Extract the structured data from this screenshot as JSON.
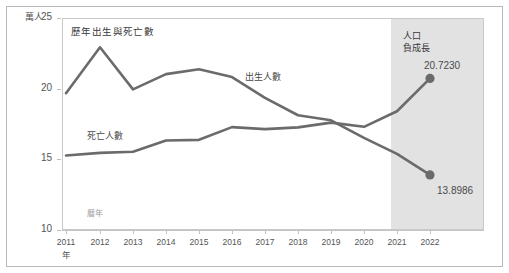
{
  "chart_data": {
    "type": "line",
    "title": "歷年出生與死亡數",
    "xlabel": "年",
    "ylabel": "萬人",
    "x": [
      2011,
      2012,
      2013,
      2014,
      2015,
      2016,
      2017,
      2018,
      2019,
      2020,
      2021,
      2022
    ],
    "categories": [
      "2011",
      "2012",
      "2013",
      "2014",
      "2015",
      "2016",
      "2017",
      "2018",
      "2019",
      "2020",
      "2021",
      "2022"
    ],
    "ylim": [
      10,
      25
    ],
    "yticks": [
      10,
      15,
      20,
      25
    ],
    "ytick_labels": [
      "10",
      "15",
      "20",
      "25"
    ],
    "grid": false,
    "legend_position": "inline-labels",
    "series": [
      {
        "name": "出生人數",
        "color": "#6b6b6b",
        "values": [
          19.68,
          22.93,
          19.95,
          21.03,
          21.37,
          20.82,
          19.35,
          18.12,
          17.76,
          16.52,
          15.39,
          13.8986
        ],
        "end_label": "13.8986"
      },
      {
        "name": "死亡人數",
        "color": "#6b6b6b",
        "values": [
          15.27,
          15.46,
          15.54,
          16.33,
          16.38,
          17.28,
          17.14,
          17.26,
          17.6,
          17.3,
          18.4,
          20.723
        ],
        "end_label": "20.7230"
      }
    ],
    "annotations": [
      {
        "text": "人口\n負成長",
        "line1": "人口",
        "line2": "負成長",
        "from_x": 2020,
        "to_x": 2022,
        "shaded": true
      },
      {
        "text": "曆年",
        "note": "small inner axis note"
      }
    ]
  },
  "labels": {
    "title": "歷年出生與死亡數",
    "y_unit": "萬人",
    "x_unit": "年",
    "band_line1": "人口",
    "band_line2": "負成長",
    "series_births": "出生人數",
    "series_deaths": "死亡人數",
    "inner_note": "曆年",
    "value_top_right": "20.7230",
    "value_bottom_right": "13.8986"
  },
  "yticks": [
    {
      "label": "25",
      "top": 18
    },
    {
      "label": "20",
      "top": 88.7
    },
    {
      "label": "15",
      "top": 159.3
    },
    {
      "label": "10",
      "top": 230
    }
  ],
  "xticks": [
    {
      "label": "2011",
      "x": 66
    },
    {
      "label": "2012",
      "x": 100
    },
    {
      "label": "2013",
      "x": 133
    },
    {
      "label": "2014",
      "x": 166
    },
    {
      "label": "2015",
      "x": 199
    },
    {
      "label": "2016",
      "x": 232
    },
    {
      "label": "2017",
      "x": 265
    },
    {
      "label": "2018",
      "x": 298
    },
    {
      "label": "2019",
      "x": 331
    },
    {
      "label": "2020",
      "x": 364
    },
    {
      "label": "2021",
      "x": 397
    },
    {
      "label": "2022",
      "x": 430
    }
  ],
  "colors": {
    "line": "#6b6b6b",
    "band": "#dddddd",
    "frame": "#b9b9b9",
    "axis": "#c4c4c4",
    "text": "#555555"
  }
}
